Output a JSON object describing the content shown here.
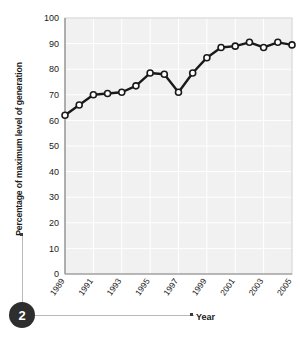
{
  "annotation": {
    "badge_number": "2"
  },
  "chart_data": {
    "type": "line",
    "title": "",
    "xlabel": "Year",
    "ylabel": "Percentage of maximum level of generation",
    "xlim": [
      1989,
      2005
    ],
    "ylim": [
      0,
      100
    ],
    "grid": true,
    "legend": null,
    "y_ticks": [
      "100",
      "90",
      "80",
      "70",
      "60",
      "50",
      "40",
      "30",
      "20",
      "10",
      "0"
    ],
    "y_tick_values": [
      100,
      90,
      80,
      70,
      60,
      50,
      40,
      30,
      20,
      10,
      0
    ],
    "x_ticks": [
      "1989",
      "1991",
      "1993",
      "1995",
      "1997",
      "1999",
      "2001",
      "2003",
      "2005"
    ],
    "x_tick_values": [
      1989,
      1991,
      1993,
      1995,
      1997,
      1999,
      2001,
      2003,
      2005
    ],
    "x": [
      1989,
      1990,
      1991,
      1992,
      1993,
      1994,
      1995,
      1996,
      1997,
      1998,
      1999,
      2000,
      2001,
      2002,
      2003,
      2004,
      2005
    ],
    "values": [
      62,
      66,
      70,
      70.5,
      71,
      73.5,
      78.5,
      78,
      71,
      78.5,
      84.5,
      88.5,
      89,
      90.5,
      88.5,
      90.5,
      89.5
    ],
    "series": [
      {
        "name": "Percentage of maximum level of generation",
        "values": [
          62,
          66,
          70,
          70.5,
          71,
          73.5,
          78.5,
          78,
          71,
          78.5,
          84.5,
          88.5,
          89,
          90.5,
          88.5,
          90.5,
          89.5
        ]
      }
    ],
    "marker": "open-circle",
    "line_color": "#1a1a1a",
    "marker_fill": "#ffffff",
    "plot_background": "#f1f1f1",
    "gridline_color": "#ffffff"
  }
}
